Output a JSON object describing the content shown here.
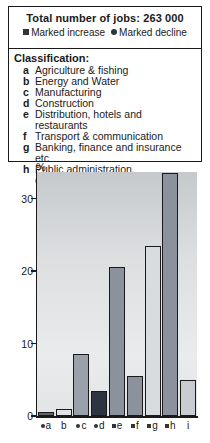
{
  "header": {
    "title": "Total number of jobs: 263 000",
    "legend": [
      {
        "marker": "square",
        "label": "Marked increase"
      },
      {
        "marker": "circle",
        "label": "Marked decline"
      }
    ]
  },
  "classification": {
    "heading": "Classification:",
    "items": [
      {
        "letter": "a",
        "label": "Agriculture & fishing"
      },
      {
        "letter": "b",
        "label": "Energy and Water"
      },
      {
        "letter": "c",
        "label": "Manufacturing"
      },
      {
        "letter": "d",
        "label": "Construction"
      },
      {
        "letter": "e",
        "label": "Distribution, hotels and restaurants"
      },
      {
        "letter": "f",
        "label": "Transport & communication"
      },
      {
        "letter": "g",
        "label": "Banking, finance and insurance etc"
      },
      {
        "letter": "h",
        "label": "Public administration,\neducation and health"
      }
    ]
  },
  "chart_data": {
    "type": "bar",
    "title": "Total number of jobs: 263 000",
    "ylabel": "%",
    "ylim": [
      0,
      35
    ],
    "yticks": [
      0,
      10,
      20,
      30
    ],
    "grid": false,
    "categories": [
      "a",
      "b",
      "c",
      "d",
      "e",
      "f",
      "g",
      "h",
      "i"
    ],
    "values": [
      0.5,
      1,
      8.5,
      3.5,
      20.5,
      5.5,
      23.5,
      33.5,
      5
    ],
    "category_markers": [
      "circle",
      null,
      "circle",
      "circle",
      "square",
      "square",
      "square",
      "square",
      null
    ],
    "bar_colors": [
      "#5f6672",
      "#e0e2e4",
      "#9ba1ab",
      "#2f3540",
      "#8b919d",
      "#8b919d",
      "#d9dcdf",
      "#8b919d",
      "#c9cdd2"
    ],
    "marker_meaning": {
      "square": "Marked increase",
      "circle": "Marked decline"
    }
  },
  "colors": {
    "marker": "#30343c",
    "axis": "#1a1a1a",
    "plot_bg_top": "#c6c9cc",
    "plot_bg_bottom": "#e9ebec"
  }
}
